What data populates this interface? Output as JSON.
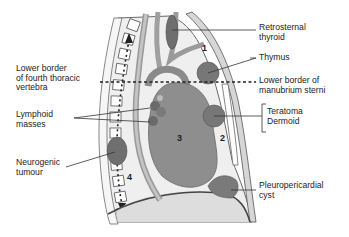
{
  "diagram": {
    "colors": {
      "background": "#ffffff",
      "mediastinum_fill": "#ededed",
      "heart_fill": "#8f8f8f",
      "mass_fill": "#7a7a7a",
      "vessel_fill": "#a8a8a8",
      "abdomen_fill": "#dcdcdc",
      "outline": "#555555",
      "label_text": "#222222"
    },
    "compartment_numbers": [
      {
        "id": "1",
        "label": "1"
      },
      {
        "id": "2",
        "label": "2"
      },
      {
        "id": "3",
        "label": "3"
      },
      {
        "id": "4",
        "label": "4"
      }
    ],
    "labels_left": [
      {
        "id": "lower-border-t4",
        "lines": [
          "Lower border",
          "of fourth thoracic",
          "vertebra"
        ]
      },
      {
        "id": "lymphoid-masses",
        "lines": [
          "Lymphoid",
          "masses"
        ]
      },
      {
        "id": "neurogenic-tumour",
        "lines": [
          "Neurogenic",
          "tumour"
        ]
      }
    ],
    "labels_right": [
      {
        "id": "retrosternal-thyroid",
        "lines": [
          "Retrosternal",
          "thyroid"
        ]
      },
      {
        "id": "thymus",
        "lines": [
          "Thymus"
        ]
      },
      {
        "id": "lower-border-manubrium",
        "lines": [
          "Lower border of",
          "manubrium sterni"
        ]
      },
      {
        "id": "teratoma-dermoid",
        "lines": [
          "Teratoma",
          "Dermoid"
        ]
      },
      {
        "id": "pleuropericardial-cyst",
        "lines": [
          "Pleuropericardial",
          "cyst"
        ]
      }
    ]
  }
}
